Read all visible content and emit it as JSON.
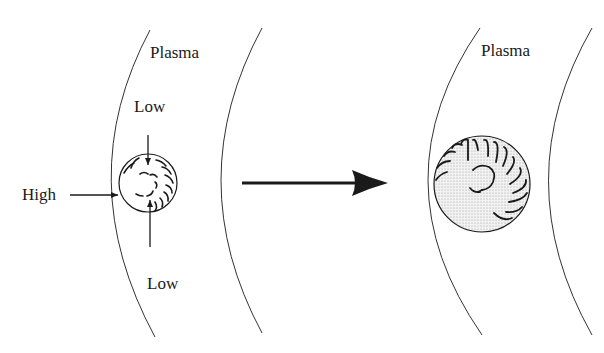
{
  "figure": {
    "colors": {
      "ink": "#1a1a1a",
      "shading": "#e4e4e4",
      "background": "#ffffff"
    },
    "left_panel": {
      "plasma_label": "Plasma",
      "top_low_label": "Low",
      "bottom_low_label": "Low",
      "high_label": "High"
    },
    "transition_arrow": {
      "direction": "right"
    },
    "right_panel": {
      "plasma_label": "Plasma"
    }
  }
}
